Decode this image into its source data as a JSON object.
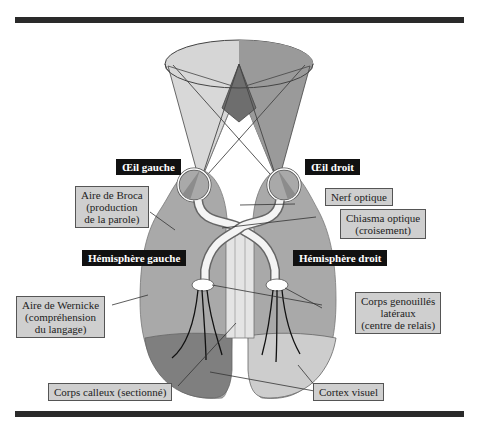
{
  "labels": {
    "left_eye": "Œil gauche",
    "right_eye": "Œil droit",
    "left_hemisphere": "Hémisphère gauche",
    "right_hemisphere": "Hémisphère droit",
    "broca": [
      "Aire de Broca",
      "(production",
      "de la parole)"
    ],
    "wernicke": [
      "Aire de Wernicke",
      "(compréhension",
      "du langage)"
    ],
    "optic_nerve": "Nerf optique",
    "optic_chiasm": [
      "Chiasma optique",
      "(croisement)"
    ],
    "lgn": [
      "Corps genouillés",
      "latéraux",
      "(centre de relais)"
    ],
    "corpus_callosum": "Corps calleux (sectionné)",
    "visual_cortex": "Cortex visuel"
  },
  "colors": {
    "rule": "#2a2a2a",
    "hemisphere": "#a9a9a9",
    "visual_cortex_left": "#7f7f7f",
    "visual_cortex_right": "#cdcdcd",
    "field_light": "#d6d6d6",
    "field_dark": "#8f8f8f",
    "label_box": "#cfcfcf",
    "label_dark": "#111111"
  }
}
